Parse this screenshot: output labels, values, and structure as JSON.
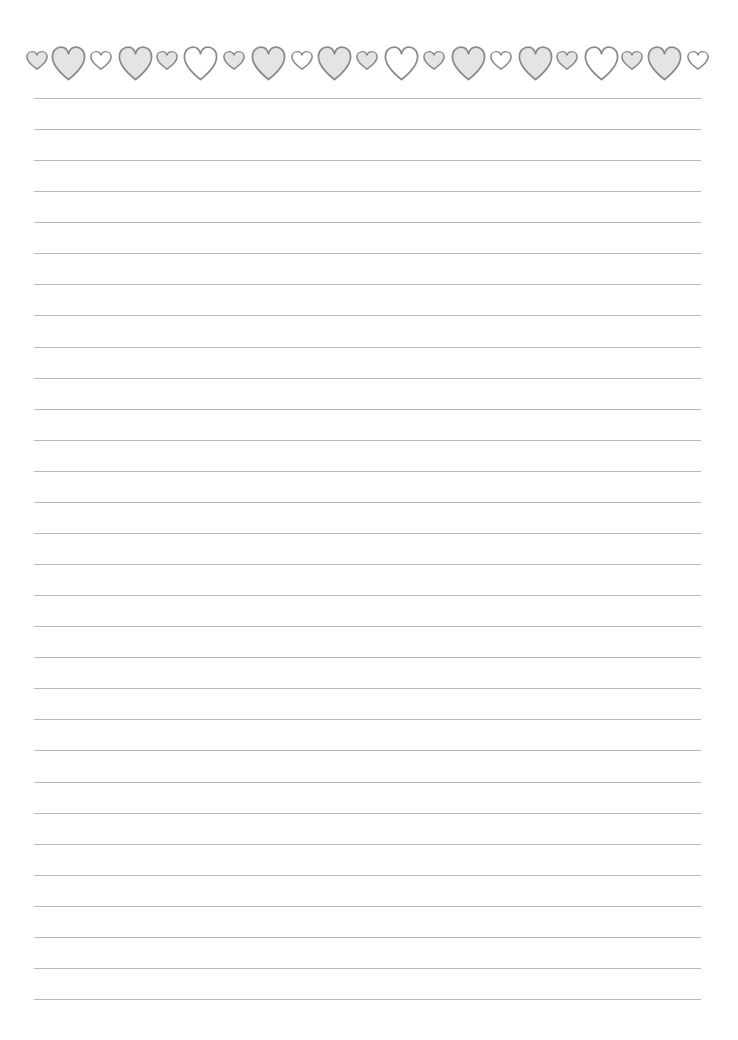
{
  "document": {
    "type": "lined-writing-paper",
    "width": 738,
    "height": 1040
  },
  "colors": {
    "heart_stroke": "#8a8a8a",
    "heart_fill_gray": "#e4e4e4",
    "heart_fill_white": "#ffffff",
    "rule_line": "#b9b9b9",
    "background": "#ffffff"
  },
  "heart_border": {
    "small": {
      "width": 22,
      "height": 19,
      "top": 51
    },
    "large": {
      "width": 35,
      "height": 35,
      "top": 46
    },
    "hearts": [
      {
        "size": "small",
        "fill": "gray",
        "cx": 37
      },
      {
        "size": "large",
        "fill": "gray",
        "cx": 68
      },
      {
        "size": "small",
        "fill": "white",
        "cx": 101
      },
      {
        "size": "large",
        "fill": "gray",
        "cx": 135
      },
      {
        "size": "small",
        "fill": "gray",
        "cx": 167
      },
      {
        "size": "large",
        "fill": "white",
        "cx": 200
      },
      {
        "size": "small",
        "fill": "gray",
        "cx": 234
      },
      {
        "size": "large",
        "fill": "gray",
        "cx": 268
      },
      {
        "size": "small",
        "fill": "white",
        "cx": 302
      },
      {
        "size": "large",
        "fill": "gray",
        "cx": 334
      },
      {
        "size": "small",
        "fill": "gray",
        "cx": 367
      },
      {
        "size": "large",
        "fill": "white",
        "cx": 401
      },
      {
        "size": "small",
        "fill": "gray",
        "cx": 434
      },
      {
        "size": "large",
        "fill": "gray",
        "cx": 468
      },
      {
        "size": "small",
        "fill": "white",
        "cx": 501
      },
      {
        "size": "large",
        "fill": "gray",
        "cx": 535
      },
      {
        "size": "small",
        "fill": "gray",
        "cx": 567
      },
      {
        "size": "large",
        "fill": "white",
        "cx": 601
      },
      {
        "size": "small",
        "fill": "gray",
        "cx": 632
      },
      {
        "size": "large",
        "fill": "gray",
        "cx": 664
      },
      {
        "size": "small",
        "fill": "white",
        "cx": 698
      }
    ]
  },
  "ruled_lines": {
    "count": 30,
    "first_y": 98,
    "spacing": 31.07,
    "x_start": 34,
    "x_end": 701
  }
}
